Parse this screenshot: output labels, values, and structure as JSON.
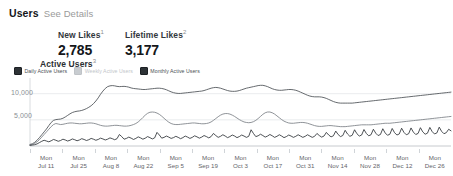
{
  "header": {
    "title": "Users",
    "details_link": "See Details"
  },
  "metrics": [
    {
      "label": "New Likes",
      "sup": "1",
      "value": "2,785"
    },
    {
      "label": "Lifetime Likes",
      "sup": "2",
      "value": "3,177"
    }
  ],
  "chart_title": "Active Users",
  "chart_title_sup": "3",
  "legend": [
    {
      "label": "Daily Active Users",
      "checked": true,
      "color": "#2d3236"
    },
    {
      "label": "Weekly Active Users",
      "checked": false,
      "color": "#c8ccd0"
    },
    {
      "label": "Monthly Active Users",
      "checked": true,
      "color": "#2d3236"
    }
  ],
  "chart_data": {
    "type": "line",
    "title": "Active Users",
    "xlabel": "",
    "ylabel": "",
    "ylim": [
      0,
      13000
    ],
    "yticks": [
      5000,
      10000
    ],
    "ytick_labels": [
      "5,000",
      "10,000"
    ],
    "grid": true,
    "legend_position": "top-left",
    "x_tick_labels": [
      {
        "top": "Mon",
        "bottom": "Jul 11"
      },
      {
        "top": "Mon",
        "bottom": "Jul 25"
      },
      {
        "top": "Mon",
        "bottom": "Aug 8"
      },
      {
        "top": "Mon",
        "bottom": "Aug 22"
      },
      {
        "top": "Mon",
        "bottom": "Sep 5"
      },
      {
        "top": "Mon",
        "bottom": "Sep 19"
      },
      {
        "top": "Mon",
        "bottom": "Oct 3"
      },
      {
        "top": "Mon",
        "bottom": "Oct 17"
      },
      {
        "top": "Mon",
        "bottom": "Oct 31"
      },
      {
        "top": "Mon",
        "bottom": "Nov 14"
      },
      {
        "top": "Mon",
        "bottom": "Nov 28"
      },
      {
        "top": "Mon",
        "bottom": "Dec 12"
      },
      {
        "top": "Mon",
        "bottom": "Dec 26"
      }
    ],
    "series": [
      {
        "name": "Monthly Active Users",
        "color": "#4a4f54",
        "values": [
          300,
          420,
          700,
          1100,
          1600,
          2150,
          2700,
          3250,
          3900,
          4500,
          4900,
          5050,
          5100,
          5150,
          5300,
          5550,
          5850,
          6150,
          6400,
          6550,
          6650,
          6700,
          6800,
          6950,
          7150,
          7400,
          7700,
          8100,
          8600,
          9200,
          9900,
          10500,
          11000,
          11350,
          11500,
          11550,
          11500,
          11400,
          11350,
          11380,
          11400,
          11350,
          11250,
          11100,
          11000,
          10950,
          10900,
          10850,
          10800,
          10800,
          10850,
          10900,
          10950,
          11000,
          11050,
          11050,
          11000,
          10900,
          10750,
          10550,
          10350,
          10200,
          10100,
          10050,
          10050,
          10100,
          10150,
          10200,
          10250,
          10300,
          10350,
          10400,
          10450,
          10500,
          10600,
          10750,
          10900,
          11050,
          11150,
          11200,
          11150,
          11050,
          10900,
          10750,
          10600,
          10500,
          10450,
          10450,
          10500,
          10600,
          10750,
          10900,
          11050,
          11150,
          11250,
          11350,
          11450,
          11550,
          11600,
          11600,
          11500,
          11350,
          11150,
          10950,
          10800,
          10700,
          10650,
          10650,
          10700,
          10750,
          10800,
          10800,
          10750,
          10650,
          10500,
          10300,
          10100,
          9900,
          9700,
          9550,
          9450,
          9400,
          9400,
          9400,
          9350,
          9250,
          9100,
          8900,
          8700,
          8500,
          8350,
          8250,
          8200,
          8200,
          8200,
          8200,
          8200,
          8200,
          8250,
          8300,
          8350,
          8400,
          8450,
          8500,
          8550,
          8600,
          8650,
          8700,
          8750,
          8800,
          8850,
          8900,
          8950,
          9000,
          9050,
          9100,
          9150,
          9200,
          9250,
          9300,
          9350,
          9400,
          9450,
          9500,
          9550,
          9600,
          9650,
          9700,
          9750,
          9800,
          9850,
          9900,
          9950,
          10000,
          10050,
          10100,
          10150,
          10200,
          10250,
          10300
        ]
      },
      {
        "name": "Weekly Active Users",
        "color": "#7b8085",
        "values": [
          200,
          300,
          500,
          800,
          1200,
          1700,
          2200,
          2700,
          3200,
          3700,
          4100,
          4300,
          4200,
          4100,
          4150,
          4250,
          4350,
          4400,
          4400,
          4350,
          4300,
          4250,
          4250,
          4300,
          4350,
          4400,
          4400,
          4350,
          4250,
          4100,
          3950,
          3850,
          3800,
          3800,
          3850,
          3900,
          3950,
          3950,
          3900,
          3850,
          3800,
          3800,
          3850,
          3950,
          4100,
          4300,
          4600,
          5000,
          5450,
          5900,
          6250,
          6450,
          6500,
          6450,
          6300,
          6050,
          5700,
          5300,
          4900,
          4550,
          4300,
          4150,
          4100,
          4100,
          4150,
          4200,
          4250,
          4300,
          4350,
          4400,
          4400,
          4350,
          4300,
          4250,
          4250,
          4300,
          4400,
          4600,
          4900,
          5250,
          5600,
          5900,
          6100,
          6200,
          6200,
          6100,
          5900,
          5650,
          5350,
          5050,
          4800,
          4600,
          4500,
          4450,
          4500,
          4650,
          4900,
          5250,
          5650,
          6050,
          6350,
          6500,
          6500,
          6350,
          6100,
          5750,
          5400,
          5050,
          4750,
          4550,
          4400,
          4350,
          4350,
          4400,
          4450,
          4500,
          4500,
          4450,
          4350,
          4200,
          4050,
          3900,
          3800,
          3750,
          3750,
          3800,
          3850,
          3900,
          3900,
          3850,
          3800,
          3750,
          3700,
          3700,
          3700,
          3750,
          3800,
          3850,
          3900,
          3950,
          4000,
          4050,
          4050,
          4050,
          4050,
          4050,
          4100,
          4150,
          4200,
          4250,
          4300,
          4350,
          4350,
          4350,
          4400,
          4450,
          4500,
          4550,
          4600,
          4650,
          4700,
          4750,
          4800,
          4850,
          4900,
          4950,
          5000,
          5050,
          5100,
          5150,
          5200,
          5250,
          5300,
          5350,
          5400,
          5450,
          5500,
          5550,
          5600,
          5650
        ]
      },
      {
        "name": "Daily Active Users",
        "color": "#2d3236",
        "values": [
          120,
          180,
          250,
          400,
          650,
          900,
          1100,
          950,
          800,
          1000,
          1250,
          1100,
          900,
          1050,
          1300,
          1150,
          950,
          1100,
          1350,
          1200,
          1000,
          1150,
          1400,
          1250,
          1050,
          1200,
          1450,
          1300,
          1100,
          1250,
          1500,
          1350,
          1150,
          1300,
          1550,
          1400,
          1200,
          1400,
          2200,
          1800,
          1300,
          1450,
          1700,
          1500,
          1250,
          1450,
          1750,
          1550,
          1300,
          1500,
          1800,
          1600,
          1350,
          1550,
          2600,
          2100,
          1500,
          1650,
          1900,
          1700,
          1450,
          1600,
          1850,
          1650,
          1400,
          1600,
          1900,
          1700,
          1450,
          1650,
          1950,
          1750,
          1500,
          1700,
          2000,
          1800,
          1550,
          1800,
          2400,
          2000,
          1650,
          1850,
          2150,
          1900,
          1600,
          1800,
          2100,
          1900,
          1600,
          1800,
          2100,
          1900,
          1650,
          1850,
          3100,
          2400,
          1800,
          1950,
          2250,
          2000,
          1700,
          1900,
          2200,
          1950,
          1650,
          1850,
          2150,
          1900,
          1600,
          1800,
          2100,
          1900,
          1650,
          1850,
          2150,
          1900,
          1650,
          1850,
          2150,
          1900,
          1650,
          1850,
          2400,
          2000,
          1700,
          1900,
          2600,
          2100,
          1750,
          1950,
          2850,
          2200,
          1800,
          2000,
          3000,
          2300,
          1850,
          2050,
          3100,
          2350,
          1900,
          2100,
          3150,
          2400,
          1950,
          2150,
          3200,
          2450,
          2000,
          2200,
          3300,
          2500,
          2050,
          2250,
          3350,
          2550,
          2100,
          2300,
          3400,
          2600,
          2150,
          2350,
          3450,
          2650,
          2200,
          2400,
          3500,
          2700,
          2250,
          2450,
          3550,
          2750,
          2300,
          2500,
          3600,
          2800,
          2350,
          2550,
          3200,
          2900
        ]
      }
    ]
  }
}
